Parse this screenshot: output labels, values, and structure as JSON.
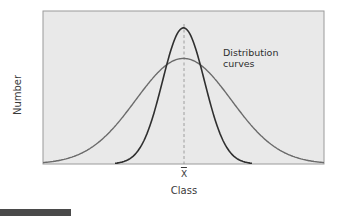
{
  "chart_data": {
    "type": "line",
    "title": "",
    "xlabel": "Class",
    "ylabel": "Number",
    "x_tick_labels": [
      "X̄"
    ],
    "x_tick_meaning": "mean (X-bar) at center",
    "grid": false,
    "legend": null,
    "annotations": [
      {
        "text": "Distribution curves",
        "lines": [
          "Distribution",
          "curves"
        ]
      }
    ],
    "mean_line": {
      "style": "dashed",
      "x": 0.5
    },
    "series": [
      {
        "name": "wide distribution",
        "shape": "normal",
        "mean": 0.5,
        "relative_sd": 0.17,
        "peak_height": 0.69,
        "color": "#6b6b6b"
      },
      {
        "name": "narrow distribution",
        "shape": "normal",
        "mean": 0.5,
        "relative_sd": 0.075,
        "peak_height": 0.89,
        "color": "#2f2f2f"
      }
    ],
    "xlim": [
      0,
      1
    ],
    "ylim": [
      0,
      1
    ]
  },
  "colors": {
    "plot_background": "#e9e9e9",
    "plot_border": "#9a9a9a",
    "wide_curve": "#6b6b6b",
    "narrow_curve": "#2f2f2f",
    "mean_line": "#8a8a8a",
    "footer_bar": "#4a4a4a"
  },
  "labels": {
    "y_axis": "Number",
    "x_axis": "Class",
    "x_tick": "X",
    "annotation_line1": "Distribution",
    "annotation_line2": "curves"
  }
}
